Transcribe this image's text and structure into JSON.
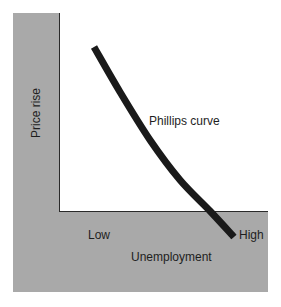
{
  "chart_data": {
    "type": "line",
    "title": "",
    "xlabel": "Unemployment",
    "ylabel": "Price rise",
    "x_tick_labels": [
      "Low",
      "High"
    ],
    "y_tick_labels": [],
    "grid": false,
    "legend": null,
    "annotations": [
      {
        "text": "Phillips curve",
        "position": "right of curve, mid-height"
      }
    ],
    "series": [
      {
        "name": "Phillips curve",
        "description": "Downward-sloping, slightly convex curve: high price rise at low unemployment, low price rise at high unemployment",
        "points_pixel": [
          [
            94,
            47
          ],
          [
            120,
            92
          ],
          [
            150,
            140
          ],
          [
            180,
            180
          ],
          [
            210,
            211
          ],
          [
            234,
            237
          ]
        ],
        "points_normalized": [
          [
            0.17,
            0.83
          ],
          [
            0.29,
            0.6
          ],
          [
            0.43,
            0.36
          ],
          [
            0.58,
            0.16
          ],
          [
            0.72,
            0.0
          ],
          [
            0.84,
            -0.13
          ]
        ]
      }
    ],
    "colors": {
      "background_band": "#a9a9a9",
      "plot_area": "#ffffff",
      "curve": "#1a1a1a",
      "axis": "#2a2a2a"
    }
  },
  "labels": {
    "ylabel": "Price rise",
    "curve": "Phillips curve",
    "x_low": "Low",
    "x_high": "High",
    "xlabel": "Unemployment"
  }
}
